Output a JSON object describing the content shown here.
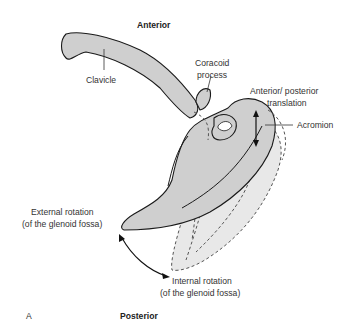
{
  "figure": {
    "panel_letter": "A",
    "orientation_top": "Anterior",
    "orientation_bottom": "Posterior"
  },
  "labels": {
    "clavicle": "Clavicle",
    "coracoid_line1": "Coracoid",
    "coracoid_line2": "process",
    "translation_line1": "Anterior/ posterior",
    "translation_line2": "translation",
    "acromion": "Acromion",
    "external_line1": "External rotation",
    "external_line2": "(of the glenoid fossa)",
    "internal_line1": "Internal rotation",
    "internal_line2": "(of the glenoid fossa)"
  },
  "colors": {
    "bone_fill": "#cfcfcf",
    "ghost_fill": "#e8e8e8",
    "outline": "#1a1a1a"
  }
}
